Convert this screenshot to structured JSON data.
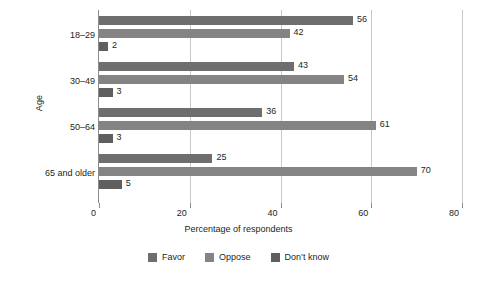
{
  "chart_data": {
    "type": "bar",
    "orientation": "horizontal",
    "title": "",
    "xlabel": "Percentage of respondents",
    "ylabel": "Age",
    "categories": [
      "18–29",
      "30–49",
      "50–64",
      "65 and older"
    ],
    "series": [
      {
        "name": "Favor",
        "color": "#6e6e6e",
        "values": [
          56,
          42,
          43,
          36
        ]
      },
      {
        "name": "Oppose",
        "color": "#848484",
        "values": [
          42,
          54,
          61,
          70
        ]
      },
      {
        "name": "Don’t know",
        "color": "#5f5f5f",
        "values": [
          2,
          3,
          3,
          5
        ]
      }
    ],
    "groups": [
      {
        "category": "18–29",
        "bars": [
          {
            "series": "Favor",
            "value": 56
          },
          {
            "series": "Oppose",
            "value": 42
          },
          {
            "series": "Don’t know",
            "value": 2
          }
        ]
      },
      {
        "category": "30–49",
        "bars": [
          {
            "series": "Favor",
            "value": 43
          },
          {
            "series": "Oppose",
            "value": 54
          },
          {
            "series": "Don’t know",
            "value": 3
          }
        ]
      },
      {
        "category": "50–64",
        "bars": [
          {
            "series": "Favor",
            "value": 36
          },
          {
            "series": "Oppose",
            "value": 61
          },
          {
            "series": "Don’t know",
            "value": 3
          }
        ]
      },
      {
        "category": "65 and older",
        "bars": [
          {
            "series": "Favor",
            "value": 25
          },
          {
            "series": "Oppose",
            "value": 70
          },
          {
            "series": "Don’t know",
            "value": 5
          }
        ]
      }
    ],
    "xlim": [
      0,
      80
    ],
    "xticks": [
      0,
      20,
      40,
      60,
      80
    ],
    "xtick_labels": [
      "0",
      "20",
      "40",
      "60",
      "80"
    ],
    "grid": true,
    "grid_axis": "x",
    "legend_position": "bottom-center",
    "legend": [
      "Favor",
      "Oppose",
      "Don’t know"
    ],
    "value_labels": true,
    "background": "#ffffff"
  },
  "axes": {
    "y_title": "Age",
    "x_title": "Percentage of respondents"
  },
  "legend_items": [
    {
      "label": "Favor",
      "swatch": "favor"
    },
    {
      "label": "Oppose",
      "swatch": "oppose"
    },
    {
      "label": "Don’t know",
      "swatch": "dontknow"
    }
  ]
}
